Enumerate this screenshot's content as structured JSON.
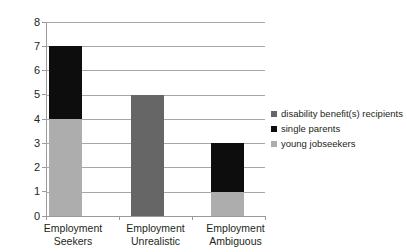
{
  "chart_data": {
    "type": "bar",
    "subtype": "stacked-bar",
    "title": "",
    "subtitle": "",
    "xlabel": "",
    "ylabel": "",
    "categories": [
      "Employment Seekers",
      "Employment Unrealistic",
      "Employment Ambiguous"
    ],
    "category_lines": [
      [
        "Employment",
        "Seekers"
      ],
      [
        "Employment",
        "Unrealistic"
      ],
      [
        "Employment",
        "Ambiguous"
      ]
    ],
    "series": [
      {
        "name": "disability benefit(s) recipients",
        "color": "#666666",
        "values": [
          0,
          5,
          0
        ]
      },
      {
        "name": "single parents",
        "color": "#0d0d0d",
        "values": [
          3,
          0,
          2
        ]
      },
      {
        "name": "young jobseekers",
        "color": "#adadad",
        "values": [
          4,
          0,
          1
        ]
      }
    ],
    "stack_order_bottom_to_top": [
      "young jobseekers",
      "disability benefit(s) recipients",
      "single parents"
    ],
    "totals": [
      7,
      5,
      3
    ],
    "ylim": [
      0,
      8
    ],
    "ytick_step": 1,
    "yticks": [
      "8",
      "7",
      "6",
      "5",
      "4",
      "3",
      "2",
      "1",
      "0"
    ],
    "grid": "horizontal",
    "legend_position": "right"
  },
  "legend": {
    "items": [
      {
        "label": "disability benefit(s) recipients",
        "color": "#666666"
      },
      {
        "label": "single parents",
        "color": "#0d0d0d"
      },
      {
        "label": "young jobseekers",
        "color": "#adadad"
      }
    ]
  },
  "axis": {
    "y_labels": [
      "8",
      "7",
      "6",
      "5",
      "4",
      "3",
      "2",
      "1",
      "0"
    ]
  }
}
